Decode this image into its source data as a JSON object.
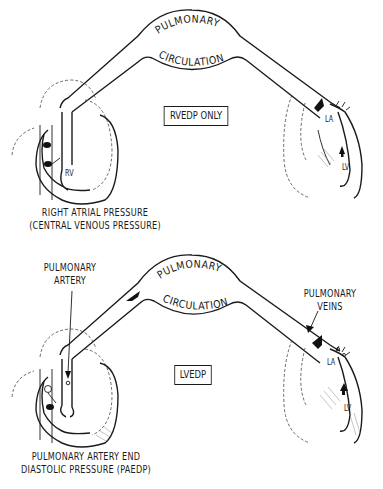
{
  "diagrams": [
    {
      "id": "top",
      "title_upper": "PULMONARY",
      "title_lower": "CIRCULATION",
      "box_label": "RVEDP ONLY",
      "chamber_labels": {
        "right_ventricle": "RV",
        "left_atrium": "LA",
        "left_ventricle": "LV"
      },
      "caption_line1": "RIGHT ATRIAL PRESSURE",
      "caption_line2": "(CENTRAL VENOUS PRESSURE)"
    },
    {
      "id": "bottom",
      "title_upper": "PULMONARY",
      "title_lower": "CIRCULATION",
      "box_label": "LVEDP",
      "callout_left_line1": "PULMONARY",
      "callout_left_line2": "ARTERY",
      "callout_right_line1": "PULMONARY",
      "callout_right_line2": "VEINS",
      "chamber_labels": {
        "left_atrium": "LA",
        "left_ventricle": "LV"
      },
      "caption_line1": "PULMONARY ARTERY END",
      "caption_line2": "DIASTOLIC PRESSURE (PAEDP)"
    }
  ]
}
